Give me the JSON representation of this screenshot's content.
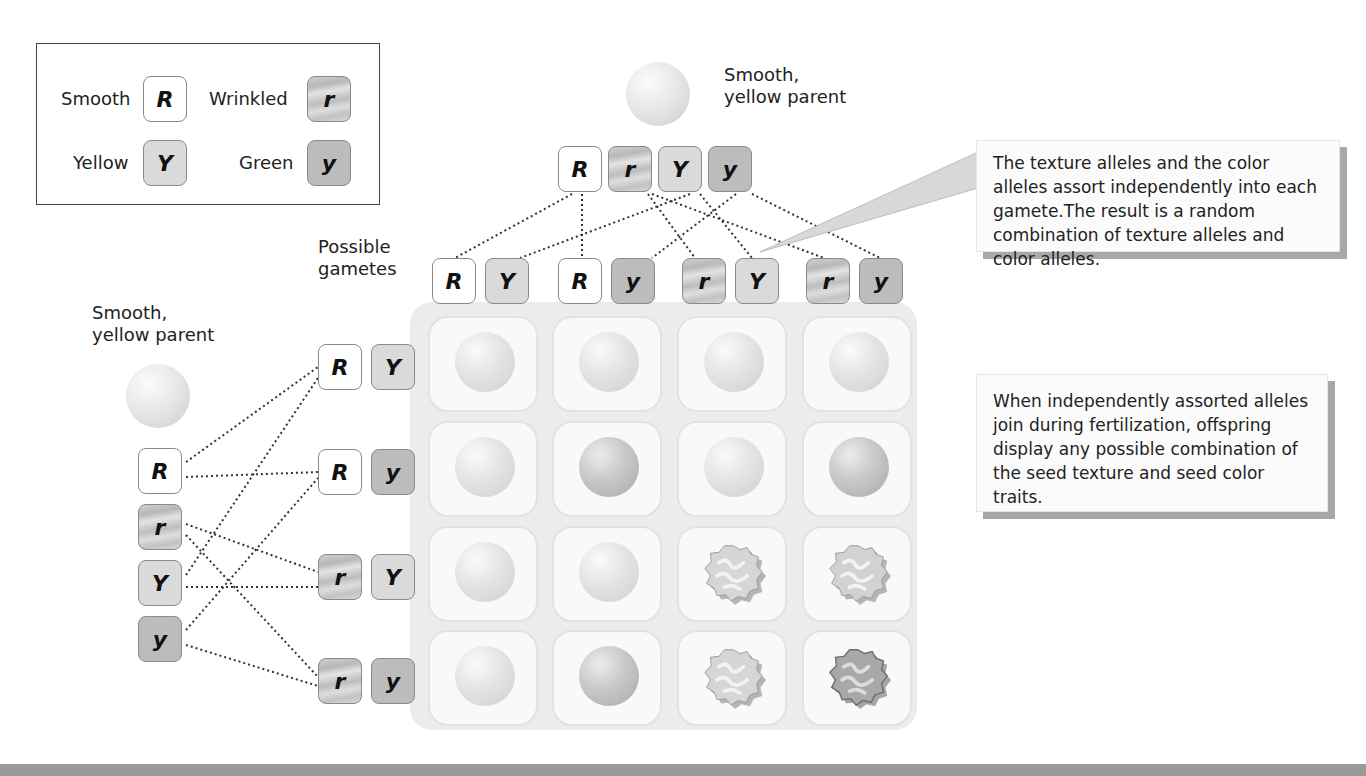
{
  "legend": {
    "items": [
      {
        "label": "Smooth",
        "allele": "R",
        "type": "R"
      },
      {
        "label": "Wrinkled",
        "allele": "r",
        "type": "r"
      },
      {
        "label": "Yellow",
        "allele": "Y",
        "type": "Y"
      },
      {
        "label": "Green",
        "allele": "y",
        "type": "y"
      }
    ]
  },
  "top_parent": {
    "label_line1": "Smooth,",
    "label_line2": "yellow parent",
    "alleles": [
      "R",
      "r",
      "Y",
      "y"
    ]
  },
  "left_parent": {
    "label_line1": "Smooth,",
    "label_line2": "yellow parent",
    "alleles": [
      "R",
      "r",
      "Y",
      "y"
    ]
  },
  "gametes_label": {
    "line1": "Possible",
    "line2": "gametes"
  },
  "column_gametes": [
    [
      "R",
      "Y"
    ],
    [
      "R",
      "y"
    ],
    [
      "r",
      "Y"
    ],
    [
      "r",
      "y"
    ]
  ],
  "row_gametes": [
    [
      "R",
      "Y"
    ],
    [
      "R",
      "y"
    ],
    [
      "r",
      "Y"
    ],
    [
      "r",
      "y"
    ]
  ],
  "offspring_grid": [
    [
      "smooth-yellow",
      "smooth-yellow",
      "smooth-yellow",
      "smooth-yellow"
    ],
    [
      "smooth-yellow",
      "smooth-green",
      "smooth-yellow",
      "smooth-green"
    ],
    [
      "smooth-yellow",
      "smooth-yellow",
      "wrinkled-yellow",
      "wrinkled-yellow"
    ],
    [
      "smooth-yellow",
      "smooth-green",
      "wrinkled-yellow",
      "wrinkled-green"
    ]
  ],
  "callouts": {
    "assortment": "The texture alleles and the color alleles assort independently into each gamete.The result is a random combination of texture alleles and color alleles.",
    "fertilization": "When independently assorted alleles join during fertilization, offspring display any possible combination of the seed texture and seed color traits."
  }
}
